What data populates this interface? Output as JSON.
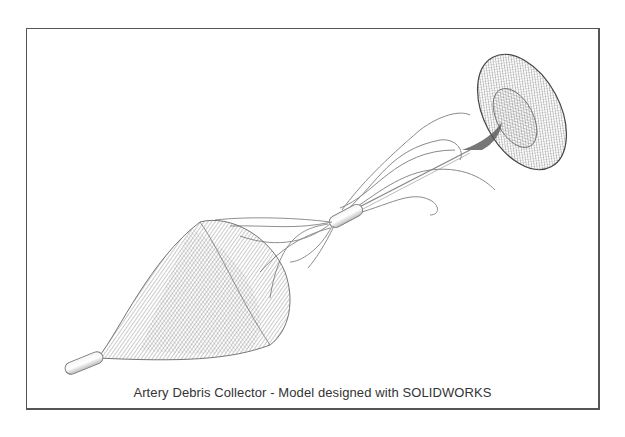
{
  "figure": {
    "caption": "Artery Debris Collector - Model designed with SOLIDWORKS",
    "components": [
      {
        "name": "toroidal-anchor",
        "description": "wireframe torus / funnel at upper right"
      },
      {
        "name": "helical-struts-upper",
        "description": "twisted wire struts between torus and sleeve"
      },
      {
        "name": "sleeve",
        "description": "cylindrical tube connector at center"
      },
      {
        "name": "helical-struts-lower",
        "description": "wire struts fanning into the basket"
      },
      {
        "name": "collection-basket",
        "description": "conical mesh basket at lower left"
      },
      {
        "name": "tip-tube",
        "description": "rounded tube tip at lower left"
      }
    ],
    "colors": {
      "frame": "#555555",
      "mesh": "#6e6e6e",
      "wire": "#8a8a8a",
      "background": "#ffffff"
    }
  }
}
